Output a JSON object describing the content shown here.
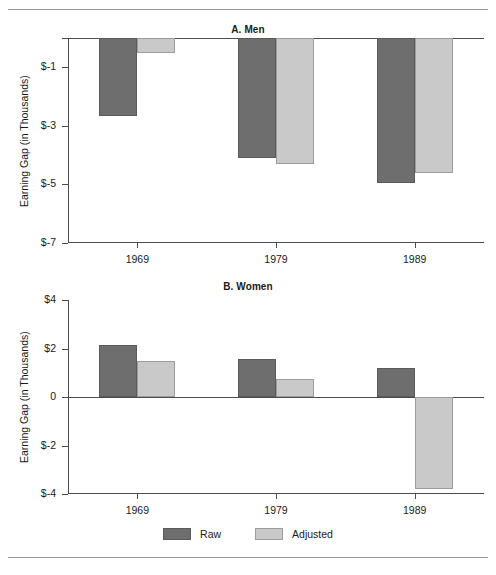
{
  "figure": {
    "ylabel": "Earning Gap (in Thousands)",
    "legend": {
      "raw_label": "Raw",
      "adjusted_label": "Adjusted",
      "raw_color": "#6e6e6e",
      "adjusted_color": "#c9c9c9"
    }
  },
  "chart_data": [
    {
      "type": "bar",
      "title": "A. Men",
      "xlabel": "",
      "ylabel": "Earning Gap (in Thousands)",
      "categories": [
        "1969",
        "1979",
        "1989"
      ],
      "series": [
        {
          "name": "Raw",
          "color": "#6e6e6e",
          "values": [
            -2.65,
            -4.1,
            -4.95
          ]
        },
        {
          "name": "Adjusted",
          "color": "#c9c9c9",
          "values": [
            -0.5,
            -4.3,
            -4.6
          ]
        }
      ],
      "ylim": [
        -7,
        0
      ],
      "yticks": [
        0,
        -1,
        -3,
        -5,
        -7
      ],
      "ytick_labels": [
        "",
        "$-1",
        "$-3",
        "$-5",
        "$-7"
      ],
      "grid": false,
      "legend_position": "bottom"
    },
    {
      "type": "bar",
      "title": "B. Women",
      "xlabel": "",
      "ylabel": "Earning Gap (in Thousands)",
      "categories": [
        "1969",
        "1979",
        "1989"
      ],
      "series": [
        {
          "name": "Raw",
          "color": "#6e6e6e",
          "values": [
            2.15,
            1.55,
            1.2
          ]
        },
        {
          "name": "Adjusted",
          "color": "#c9c9c9",
          "values": [
            1.5,
            0.75,
            -3.8
          ]
        }
      ],
      "ylim": [
        -4,
        4
      ],
      "yticks": [
        4,
        2,
        0,
        -2,
        -4
      ],
      "ytick_labels": [
        "$4",
        "$2",
        "0",
        "$-2",
        "$-4"
      ],
      "grid": false,
      "legend_position": "bottom"
    }
  ]
}
